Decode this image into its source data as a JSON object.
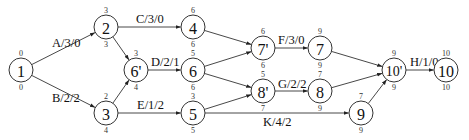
{
  "diagram": {
    "type": "activity-network",
    "nodes": [
      {
        "id": "1",
        "label": "1",
        "x": 21,
        "y": 70,
        "top": "0",
        "bottom": "0"
      },
      {
        "id": "2",
        "label": "2",
        "x": 106,
        "y": 27,
        "top": "3",
        "bottom": "3"
      },
      {
        "id": "3",
        "label": "3",
        "x": 106,
        "y": 113,
        "top": "2",
        "bottom": "4"
      },
      {
        "id": "6p",
        "label": "6'",
        "x": 136,
        "y": 70,
        "top": "3",
        "bottom": "4"
      },
      {
        "id": "4",
        "label": "4",
        "x": 193,
        "y": 27,
        "top": "6",
        "bottom": "6"
      },
      {
        "id": "6",
        "label": "6",
        "x": 193,
        "y": 70,
        "top": "5",
        "bottom": "6"
      },
      {
        "id": "5",
        "label": "5",
        "x": 193,
        "y": 113,
        "top": "3",
        "bottom": "5"
      },
      {
        "id": "7p",
        "label": "7'",
        "x": 263,
        "y": 48,
        "top": "6",
        "bottom": "6"
      },
      {
        "id": "8p",
        "label": "8'",
        "x": 263,
        "y": 91,
        "top": "5",
        "bottom": "7"
      },
      {
        "id": "7",
        "label": "7",
        "x": 320,
        "y": 48,
        "top": "9",
        "bottom": "9"
      },
      {
        "id": "8",
        "label": "8",
        "x": 320,
        "y": 91,
        "top": "7",
        "bottom": "9"
      },
      {
        "id": "9",
        "label": "9",
        "x": 361,
        "y": 113,
        "top": "7",
        "bottom": "9"
      },
      {
        "id": "10p",
        "label": "10'",
        "x": 394,
        "y": 70,
        "top": "9",
        "bottom": "9"
      },
      {
        "id": "10",
        "label": "10",
        "x": 446,
        "y": 70,
        "top": "10",
        "bottom": "10"
      }
    ],
    "edges": [
      {
        "from": "1",
        "to": "2",
        "label": "A/3/0",
        "lx": 52,
        "ly": 47
      },
      {
        "from": "1",
        "to": "3",
        "label": "B/2/2",
        "lx": 52,
        "ly": 102
      },
      {
        "from": "2",
        "to": "4",
        "label": "C/3/0",
        "lx": 136,
        "ly": 23
      },
      {
        "from": "2",
        "to": "6p",
        "label": "",
        "lx": 0,
        "ly": 0
      },
      {
        "from": "3",
        "to": "6p",
        "label": "",
        "lx": 0,
        "ly": 0
      },
      {
        "from": "6p",
        "to": "6",
        "label": "D/2/1",
        "lx": 151,
        "ly": 66
      },
      {
        "from": "3",
        "to": "5",
        "label": "E/1/2",
        "lx": 137,
        "ly": 109
      },
      {
        "from": "4",
        "to": "7p",
        "label": "",
        "lx": 0,
        "ly": 0
      },
      {
        "from": "6",
        "to": "7p",
        "label": "",
        "lx": 0,
        "ly": 0
      },
      {
        "from": "6",
        "to": "8p",
        "label": "",
        "lx": 0,
        "ly": 0
      },
      {
        "from": "5",
        "to": "8p",
        "label": "",
        "lx": 0,
        "ly": 0
      },
      {
        "from": "7p",
        "to": "7",
        "label": "F/3/0",
        "lx": 278,
        "ly": 44
      },
      {
        "from": "8p",
        "to": "8",
        "label": "G/2/2",
        "lx": 278,
        "ly": 88
      },
      {
        "from": "5",
        "to": "9",
        "label": "K/4/2",
        "lx": 263,
        "ly": 126
      },
      {
        "from": "7",
        "to": "10p",
        "label": "",
        "lx": 0,
        "ly": 0
      },
      {
        "from": "8",
        "to": "10p",
        "label": "",
        "lx": 0,
        "ly": 0
      },
      {
        "from": "9",
        "to": "10p",
        "label": "",
        "lx": 0,
        "ly": 0
      },
      {
        "from": "10p",
        "to": "10",
        "label": "H/1/0",
        "lx": 410,
        "ly": 66
      }
    ]
  }
}
